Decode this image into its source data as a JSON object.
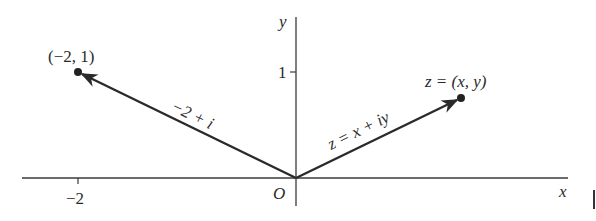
{
  "diagram": {
    "type": "complex-plane-vectors",
    "axes": {
      "x_label": "x",
      "y_label": "y",
      "origin_label": "O",
      "x_ticks": [
        {
          "value": -2,
          "label": "−2"
        }
      ],
      "y_ticks": [
        {
          "value": 1,
          "label": "1"
        }
      ]
    },
    "points": [
      {
        "coords": [
          -2,
          1
        ],
        "label": "(−2, 1)",
        "vector_label": "−2 + i"
      },
      {
        "coords": [
          "x",
          "y"
        ],
        "label": "z = (x, y)",
        "vector_label": "z = x + iy"
      }
    ],
    "colors": {
      "ink": "#2a2a2a",
      "background": "#ffffff"
    }
  }
}
